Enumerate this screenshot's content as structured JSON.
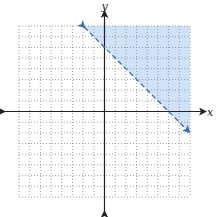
{
  "chart_data": {
    "type": "line",
    "title": "",
    "xlabel": "x",
    "ylabel": "y",
    "xlim": [
      -8,
      8
    ],
    "ylim": [
      -8,
      8
    ],
    "grid": true,
    "grid_style": "dotted",
    "series": [
      {
        "name": "boundary line y = -x + 6",
        "style": "dashed",
        "color": "#3a6fb5",
        "x": [
          -2,
          8
        ],
        "values": [
          8,
          -2
        ]
      }
    ],
    "shaded_region": {
      "description": "region above dashed line y = -x + 6 (y > -x + 6)",
      "color": "#cfe2f7"
    },
    "inequality": "y > -x + 6"
  },
  "axes": {
    "x_label": "x",
    "y_label": "y"
  },
  "colors": {
    "shade": "#cfe2f7",
    "line": "#3a6fb5",
    "axis": "#222222",
    "grid": "#8a8a8a"
  }
}
